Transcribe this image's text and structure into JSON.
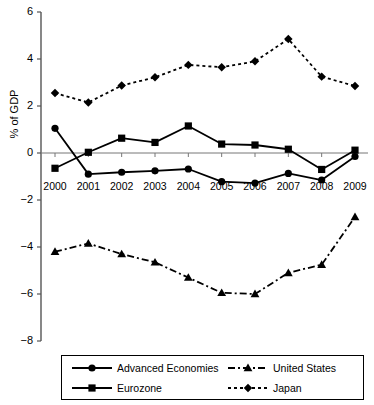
{
  "chart_data": {
    "type": "line",
    "title": "",
    "xlabel": "",
    "ylabel": "% of GDP",
    "categories": [
      "2000",
      "2001",
      "2002",
      "2003",
      "2004",
      "2005",
      "2006",
      "2007",
      "2008",
      "2009"
    ],
    "x": [
      2000,
      2001,
      2002,
      2003,
      2004,
      2005,
      2006,
      2007,
      2008,
      2009
    ],
    "ylim": [
      -8,
      6
    ],
    "xlim": [
      2000,
      2009
    ],
    "yticks": [
      6,
      4,
      2,
      0,
      -2,
      -4,
      -6,
      -8
    ],
    "ytick_labels": [
      "6",
      "4",
      "2",
      "0",
      "−2",
      "−4",
      "−6",
      "−8"
    ],
    "grid": false,
    "legend_position": "bottom",
    "zero_line": true,
    "series": [
      {
        "name": "Advanced Economies",
        "marker": "circle",
        "line_style": "solid",
        "color": "#000000",
        "values": [
          1.05,
          -0.9,
          -0.82,
          -0.76,
          -0.68,
          -1.22,
          -1.28,
          -0.87,
          -1.15,
          -0.15
        ]
      },
      {
        "name": "Eurozone",
        "marker": "square",
        "line_style": "solid",
        "color": "#000000",
        "values": [
          -0.65,
          0.03,
          0.63,
          0.45,
          1.15,
          0.38,
          0.34,
          0.16,
          -0.7,
          0.12
        ]
      },
      {
        "name": "United States",
        "marker": "triangle",
        "line_style": "dashdot",
        "color": "#000000",
        "values": [
          -4.2,
          -3.85,
          -4.3,
          -4.65,
          -5.3,
          -5.95,
          -6.0,
          -5.1,
          -4.75,
          -2.72
        ]
      },
      {
        "name": "Japan",
        "marker": "diamond",
        "line_style": "dotted",
        "color": "#000000",
        "values": [
          2.55,
          2.15,
          2.87,
          3.22,
          3.75,
          3.65,
          3.9,
          4.85,
          3.25,
          2.85
        ]
      }
    ]
  },
  "legend": {
    "entries": [
      {
        "label": "Advanced Economies",
        "marker": "circle",
        "line_style": "solid"
      },
      {
        "label": "Eurozone",
        "marker": "square",
        "line_style": "solid"
      },
      {
        "label": "United States",
        "marker": "triangle",
        "line_style": "dashdot"
      },
      {
        "label": "Japan",
        "marker": "diamond",
        "line_style": "dotted"
      }
    ]
  },
  "axis": {
    "y_title": "% of GDP"
  }
}
